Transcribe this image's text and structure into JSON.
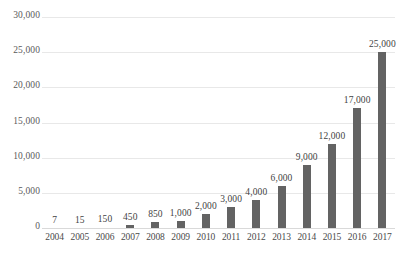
{
  "chart_data": {
    "type": "bar",
    "title": "",
    "subtitle": "",
    "xlabel": "",
    "ylabel": "",
    "categories": [
      "2004",
      "2005",
      "2006",
      "2007",
      "2008",
      "2009",
      "2010",
      "2011",
      "2012",
      "2013",
      "2014",
      "2015",
      "2016",
      "2017"
    ],
    "values": [
      7,
      15,
      150,
      450,
      850,
      1000,
      2000,
      3000,
      4000,
      6000,
      9000,
      12000,
      17000,
      25000
    ],
    "data_labels": [
      "7",
      "15",
      "150",
      "450",
      "850",
      "1,000",
      "2,000",
      "3,000",
      "4,000",
      "6,000",
      "9,000",
      "12,000",
      "17,000",
      "25,000"
    ],
    "ylim": [
      0,
      30000
    ],
    "ytick_values": [
      0,
      5000,
      10000,
      15000,
      20000,
      25000,
      30000
    ],
    "ytick_labels": [
      "0",
      "5,000",
      "10,000",
      "15,000",
      "20,000",
      "25,000",
      "30,000"
    ],
    "grid": true,
    "legend": false,
    "legend_position": "none",
    "series": [
      {
        "name": "",
        "values": [
          7,
          15,
          150,
          450,
          850,
          1000,
          2000,
          3000,
          4000,
          6000,
          9000,
          12000,
          17000,
          25000
        ]
      }
    ],
    "colors": {
      "bar": "#636363",
      "gridline": "#e8e8e8",
      "baseline": "#d9d9d9",
      "tick_text": "#5a5a5a",
      "label_text": "#3f3f3f",
      "background": "#ffffff"
    }
  }
}
